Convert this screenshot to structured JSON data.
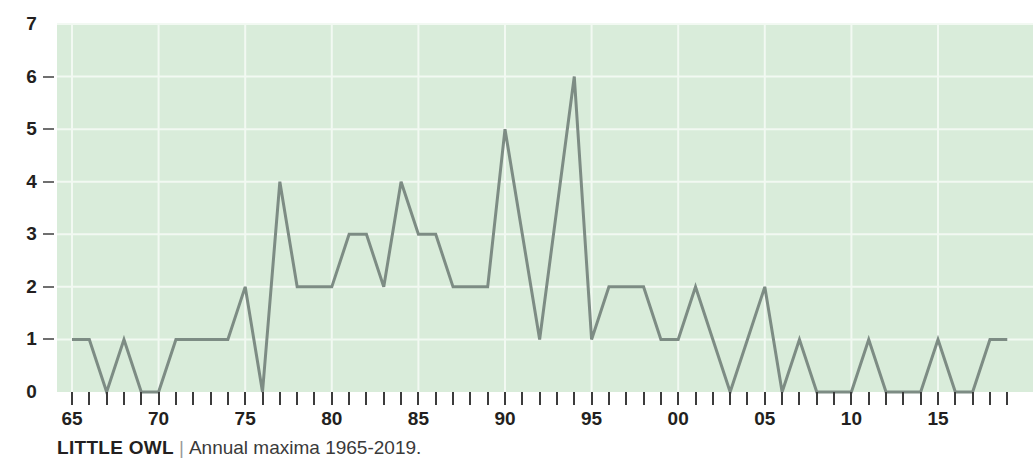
{
  "caption": {
    "species": "LITTLE OWL",
    "separator": "|",
    "subtitle": "Annual maxima 1965-2019."
  },
  "colors": {
    "plot_background": "#d9ecda",
    "gridline": "#f2f9f2",
    "series_line": "#7d8c84",
    "tick": "#3b3b3b",
    "text": "#231f20"
  },
  "chart_data": {
    "type": "line",
    "title": "LITTLE OWL",
    "subtitle": "Annual maxima 1965-2019.",
    "xlabel": "",
    "ylabel": "",
    "ylim": [
      0,
      7
    ],
    "xlim": [
      1965,
      2019
    ],
    "grid": true,
    "legend": "none",
    "y_ticks": [
      0,
      1,
      2,
      3,
      4,
      5,
      6,
      7
    ],
    "y_tick_labels": [
      "0",
      "1",
      "2",
      "3",
      "4",
      "5",
      "6",
      "7"
    ],
    "x_ticks": [
      1965,
      1970,
      1975,
      1980,
      1985,
      1990,
      1995,
      2000,
      2005,
      2010,
      2015
    ],
    "x_tick_labels": [
      "65",
      "70",
      "75",
      "80",
      "85",
      "90",
      "95",
      "00",
      "05",
      "10",
      "15"
    ],
    "x_minor_every": 1,
    "x": [
      1965,
      1966,
      1967,
      1968,
      1969,
      1970,
      1971,
      1972,
      1973,
      1974,
      1975,
      1976,
      1977,
      1978,
      1979,
      1980,
      1981,
      1982,
      1983,
      1984,
      1985,
      1986,
      1987,
      1988,
      1989,
      1990,
      1991,
      1992,
      1993,
      1994,
      1995,
      1996,
      1997,
      1998,
      1999,
      2000,
      2001,
      2002,
      2003,
      2004,
      2005,
      2006,
      2007,
      2008,
      2009,
      2010,
      2011,
      2012,
      2013,
      2014,
      2015,
      2016,
      2017,
      2018,
      2019
    ],
    "values": [
      1,
      1,
      0,
      1,
      0,
      0,
      1,
      1,
      1,
      1,
      2,
      0,
      4,
      2,
      2,
      2,
      3,
      3,
      2,
      4,
      3,
      3,
      2,
      2,
      2,
      5,
      3,
      1,
      3.5,
      6,
      1,
      2,
      2,
      2,
      1,
      1,
      2,
      1,
      0,
      1,
      2,
      0,
      1,
      0,
      0,
      0,
      1,
      0,
      0,
      0,
      1,
      0,
      0,
      1,
      1
    ],
    "categories": [
      "1965",
      "1966",
      "1967",
      "1968",
      "1969",
      "1970",
      "1971",
      "1972",
      "1973",
      "1974",
      "1975",
      "1976",
      "1977",
      "1978",
      "1979",
      "1980",
      "1981",
      "1982",
      "1983",
      "1984",
      "1985",
      "1986",
      "1987",
      "1988",
      "1989",
      "1990",
      "1991",
      "1992",
      "1993",
      "1994",
      "1995",
      "1996",
      "1997",
      "1998",
      "1999",
      "2000",
      "2001",
      "2002",
      "2003",
      "2004",
      "2005",
      "2006",
      "2007",
      "2008",
      "2009",
      "2010",
      "2011",
      "2012",
      "2013",
      "2014",
      "2015",
      "2016",
      "2017",
      "2018",
      "2019"
    ]
  }
}
